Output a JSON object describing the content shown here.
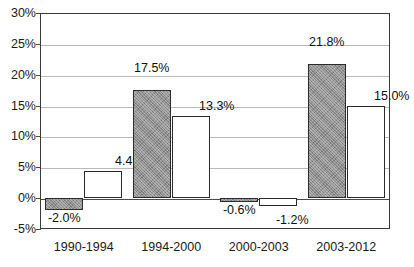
{
  "chart_data": {
    "type": "bar",
    "title": "",
    "subtitle": "",
    "xlabel": "",
    "ylabel": "",
    "categories": [
      "1990-1994",
      "1994-2000",
      "2000-2003",
      "2003-2012"
    ],
    "series": [
      {
        "name": "series-1",
        "style": "gray-filled",
        "values": [
          -2.0,
          17.5,
          -0.6,
          21.8
        ],
        "labels": [
          "-2.0%",
          "17.5%",
          "-0.6%",
          "21.8%"
        ]
      },
      {
        "name": "series-2",
        "style": "white-filled",
        "values": [
          4.4,
          13.3,
          -1.2,
          15.0
        ],
        "labels": [
          "4.4%",
          "13.3%",
          "-1.2%",
          "15.0%"
        ]
      }
    ],
    "ylim": [
      -5,
      30
    ],
    "y_ticks": [
      30,
      25,
      20,
      15,
      10,
      5,
      0,
      -5
    ],
    "y_tick_labels": [
      "30%",
      "25%",
      "20%",
      "15%",
      "10%",
      "5%",
      "0%",
      "-5%"
    ],
    "grid": true,
    "grid_axis": "y",
    "legend": null,
    "legend_position": "none",
    "colors": {
      "series_1_fill": "#8f8f8f",
      "series_2_fill": "#ffffff",
      "bar_border": "#2b2b2b",
      "gridline": "#b9b9b9",
      "zero_line": "#4a4a4a",
      "axis": "#3a3a3a",
      "text": "#1a1a1a",
      "background": "#ffffff"
    }
  }
}
